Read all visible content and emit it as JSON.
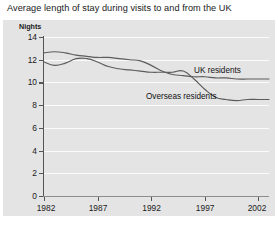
{
  "chart_data": {
    "type": "line",
    "title": "Average length of stay during visits to and from the UK",
    "ylabel": "Nights",
    "xlabel": "",
    "ylim": [
      0,
      14
    ],
    "xlim": [
      1982,
      2003
    ],
    "ytick_labels": [
      "14",
      "12",
      "10",
      "8",
      "6",
      "4",
      "2",
      "0"
    ],
    "ytick_values": [
      14,
      12,
      10,
      8,
      6,
      4,
      2,
      0
    ],
    "xtick_labels": [
      "1982",
      "1987",
      "1992",
      "1997",
      "2002"
    ],
    "xtick_values": [
      1982,
      1987,
      1992,
      1997,
      2002
    ],
    "grid": true,
    "grid_color": "#fbfbfb",
    "panel_color": "#e4e4e4",
    "line_color": "#5c5c5c",
    "legend_position": "inline-annotation",
    "x": [
      1982,
      1983,
      1984,
      1985,
      1986,
      1987,
      1988,
      1989,
      1990,
      1991,
      1992,
      1993,
      1994,
      1995,
      1996,
      1997,
      1998,
      1999,
      2000,
      2001,
      2002,
      2003
    ],
    "series": [
      {
        "name": "UK residents",
        "values": [
          12.6,
          12.7,
          12.6,
          12.4,
          12.3,
          12.2,
          12.2,
          12.1,
          12.0,
          11.9,
          11.5,
          11.0,
          10.7,
          10.6,
          10.5,
          10.5,
          10.4,
          10.4,
          10.3,
          10.3,
          10.3,
          10.3
        ]
      },
      {
        "name": "Overseas residents",
        "values": [
          11.8,
          11.5,
          11.7,
          12.1,
          12.1,
          11.8,
          11.4,
          11.2,
          11.1,
          11.0,
          10.9,
          10.9,
          10.9,
          11.0,
          10.3,
          9.4,
          8.7,
          8.5,
          8.4,
          8.5,
          8.5,
          8.5
        ]
      }
    ],
    "annotations": [
      {
        "text": "UK residents",
        "near_series": "UK residents"
      },
      {
        "text": "Overseas residents",
        "near_series": "Overseas residents"
      }
    ]
  }
}
